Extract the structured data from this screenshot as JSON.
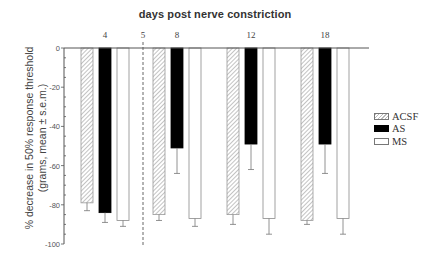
{
  "chart_data": {
    "type": "bar",
    "title": "days post nerve constriction",
    "xlabel": "days post nerve constriction",
    "ylabel": "% decrease in 50% response threshold (grams, mean ± s.e.m.)",
    "ylabel_lines": [
      "% decrease in 50% response threshold",
      "(grams, mean ± s.e.m.)"
    ],
    "categories": [
      "4",
      "8",
      "12",
      "18"
    ],
    "marker_label": "5",
    "marker_note": "dashed vertical line at day 5",
    "ylim": [
      -100,
      0
    ],
    "yticks": [
      0,
      -20,
      -40,
      -60,
      -80,
      -100
    ],
    "ytick_labels": [
      "0",
      "-20",
      "-40",
      "-60",
      "-80",
      "-100"
    ],
    "grid": false,
    "legend_position": "right",
    "series": [
      {
        "name": "ACSF",
        "style": "hatched",
        "values": [
          -79,
          -85,
          -85,
          -88
        ],
        "errors": [
          4,
          3,
          5,
          2
        ]
      },
      {
        "name": "AS",
        "style": "black",
        "values": [
          -84,
          -51,
          -49,
          -49
        ],
        "errors": [
          5,
          13,
          13,
          15
        ]
      },
      {
        "name": "MS",
        "style": "white",
        "values": [
          -88,
          -87,
          -87,
          -87
        ],
        "errors": [
          3,
          4,
          8,
          8
        ]
      }
    ]
  },
  "legend": {
    "items": [
      {
        "label": "ACSF"
      },
      {
        "label": "AS"
      },
      {
        "label": "MS"
      }
    ]
  }
}
